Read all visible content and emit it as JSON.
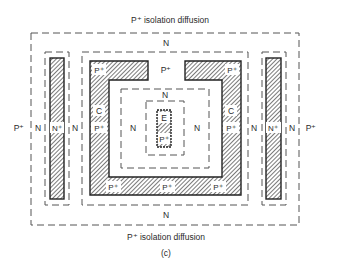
{
  "diagram": {
    "type": "IC transistor layout (top view)",
    "caption": "(c)",
    "top_label": "P⁺ isolation diffusion",
    "bottom_label": "P⁺ isolation diffusion",
    "regions": {
      "outer_n": "N",
      "outer_n_bottom": "N",
      "left_outside": "P⁺",
      "right_outside": "P⁺",
      "left_n_outer": "N",
      "left_nplus": "N⁺",
      "left_n_inner": "N",
      "right_n_inner": "N",
      "right_nplus": "N⁺",
      "right_n_outer": "N",
      "collector_top_left": "P⁺",
      "collector_top_gap": "P⁺",
      "collector_top_right": "P⁺",
      "collector_left_c": "C",
      "collector_left_p": "P⁺",
      "collector_right_c": "C",
      "collector_right_p": "P⁺",
      "collector_bottom_left": "P⁺",
      "collector_bottom_mid": "P⁺",
      "collector_bottom_right": "P⁺",
      "base_n_left": "N",
      "base_n_right": "N",
      "base_n_top": "N",
      "emitter_e": "E",
      "emitter_p": "P⁺"
    }
  }
}
